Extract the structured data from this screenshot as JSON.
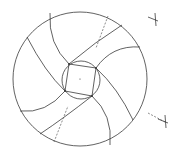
{
  "diagram": {
    "title": "",
    "colors": {
      "line": "#3a3a3a",
      "construction": "#5a5a5a",
      "background": "#ffffff"
    },
    "outer_circle": {
      "cx": 80,
      "cy": 79,
      "r": 67
    },
    "inner_circle": {
      "cx": 81,
      "cy": 80,
      "r": 19
    },
    "square": [
      [
        69,
        64
      ],
      [
        96,
        68
      ],
      [
        92,
        96
      ],
      [
        65,
        91
      ]
    ],
    "blades": [
      "M69,64 Q48,44 50,13",
      "M69,64 Q95,42 122,25",
      "M96,68 Q112,45 140,47",
      "M96,68 Q118,88 133,120",
      "M92,96 Q113,115 110,145",
      "M92,96 Q64,118 40,134",
      "M65,91 Q46,114 20,111",
      "M65,91 Q45,72 27,37"
    ],
    "construction_lines": [
      "M108,16 L96,48",
      "M54,142 L68,106",
      "M148,113 L165,122"
    ],
    "markers": [
      {
        "x": 155,
        "y": 20,
        "type": "cross"
      },
      {
        "x": 165,
        "y": 122,
        "type": "cross"
      }
    ],
    "labels": []
  }
}
